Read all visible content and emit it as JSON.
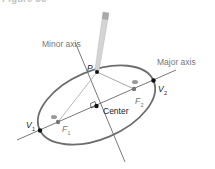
{
  "figure": {
    "caption": "Figure 35",
    "labels": {
      "minor_axis": "Minor axis",
      "major_axis": "Major axis",
      "center": "Center",
      "p": "P",
      "v1": "V",
      "v1_sub": "1",
      "v2": "V",
      "v2_sub": "2",
      "f1": "F",
      "f1_sub": "1",
      "f2": "F",
      "f2_sub": "2"
    },
    "colors": {
      "ellipse": "#6e6e6e",
      "axis_lines": "#555555",
      "string": "#b0b0b0",
      "pencil": "#c8c8c8",
      "points": "#111111",
      "foci": "#777777",
      "label_gray": "#777777"
    }
  }
}
